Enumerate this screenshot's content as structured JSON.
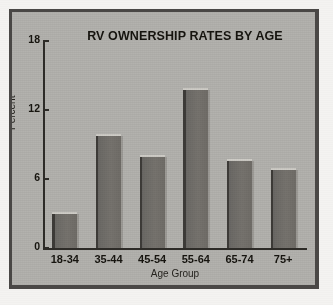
{
  "chart_data": {
    "type": "bar",
    "title": "RV OWNERSHIP RATES BY AGE",
    "xlabel": "Age Group",
    "ylabel": "Percent",
    "categories": [
      "18-34",
      "35-44",
      "45-54",
      "55-64",
      "65-74",
      "75+"
    ],
    "values": [
      3.1,
      9.9,
      8.1,
      13.9,
      7.7,
      7.0
    ],
    "ylim": [
      0,
      18
    ],
    "yticks": [
      0,
      6,
      12,
      18
    ],
    "ytick_labels": [
      "0",
      "6",
      "12",
      "18"
    ],
    "grid": false,
    "legend": false,
    "legend_position": "none",
    "series": [
      {
        "name": "Percent",
        "values": [
          3.1,
          9.9,
          8.1,
          13.9,
          7.7,
          7.0
        ]
      }
    ]
  },
  "colors": {
    "page_background": "#f4f3f1",
    "frame": "#4a4846",
    "plot_background": "#b3b2ae",
    "bar_fill": "#706d68",
    "bar_shadow": "#3d3b38",
    "bar_highlight": "#cfcdc7",
    "axis": "#2e2c28",
    "text": "#16140f"
  }
}
